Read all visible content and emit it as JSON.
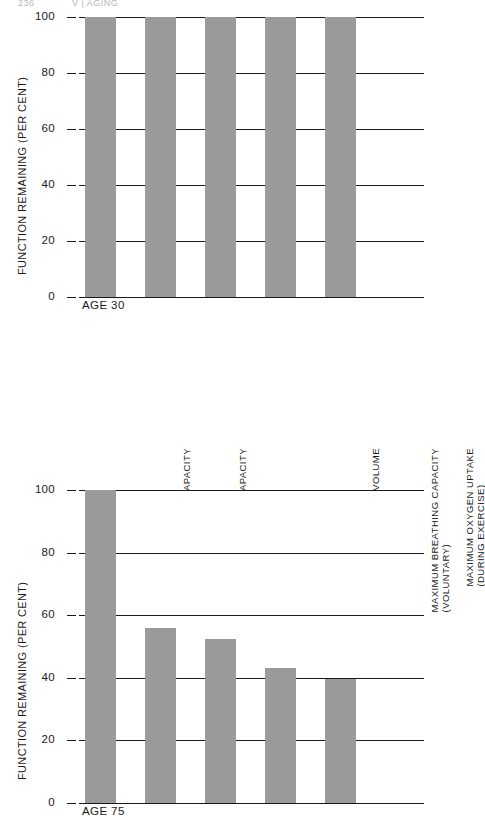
{
  "page": {
    "number": "236",
    "running_head": "V | AGING"
  },
  "chart_data": [
    {
      "id": "age-30",
      "type": "bar",
      "title": "",
      "xlabel": "AGE 30",
      "ylabel": "FUNCTION REMAINING (PER CENT)",
      "ylim": [
        0,
        100
      ],
      "yticks": [
        0,
        20,
        40,
        60,
        80,
        100
      ],
      "ytick_labels": [
        "0",
        "20",
        "40",
        "60",
        "80",
        "100"
      ],
      "grid": true,
      "legend": "none",
      "categories": [
        "TOTAL CAPACITY",
        "VITAL CAPACITY",
        "MAXIMUM VENTILATION VOLUME (DURING EXERCISE)",
        "MAXIMUM BREATHING CAPACITY (VOLUNTARY)",
        "MAXIMUM OXYGEN UPTAKE (DURING EXERCISE)"
      ],
      "values": [
        100,
        100,
        100,
        100,
        100
      ],
      "bar_color": "#9a9a9a"
    },
    {
      "id": "age-75",
      "type": "bar",
      "title": "",
      "xlabel": "AGE 75",
      "ylabel": "FUNCTION REMAINING (PER CENT)",
      "ylim": [
        0,
        100
      ],
      "yticks": [
        0,
        20,
        40,
        60,
        80,
        100
      ],
      "ytick_labels": [
        "0",
        "20",
        "40",
        "60",
        "80",
        "100"
      ],
      "grid": true,
      "legend": "none",
      "categories": [
        "TOTAL CAPACITY",
        "VITAL CAPACITY",
        "MAXIMUM VENTILATION VOLUME (DURING EXERCISE)",
        "MAXIMUM BREATHING CAPACITY (VOLUNTARY)",
        "MAXIMUM OXYGEN UPTAKE (DURING EXERCISE)"
      ],
      "values": [
        100,
        56,
        52.5,
        43,
        39.5
      ],
      "bar_color": "#9a9a9a"
    }
  ],
  "category_labels": [
    {
      "line1": "TOTAL CAPACITY",
      "line2": ""
    },
    {
      "line1": "VITAL CAPACITY",
      "line2": ""
    },
    {
      "line1": "MAXIMUM VENTILATION VOLUME",
      "line2": "(DURING EXERCISE)"
    },
    {
      "line1": "MAXIMUM BREATHING CAPACITY",
      "line2": "(VOLUNTARY)"
    },
    {
      "line1": "MAXIMUM OXYGEN UPTAKE",
      "line2": "(DURING EXERCISE)"
    }
  ]
}
